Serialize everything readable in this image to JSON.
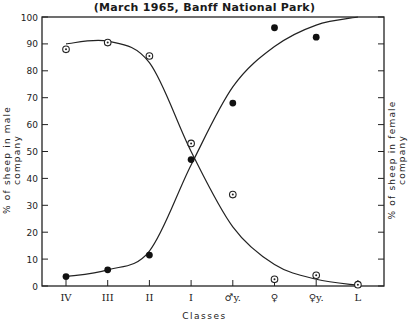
{
  "chart_data": {
    "type": "line",
    "title": "(March 1965, Banff National Park)",
    "xlabel": "Classes",
    "ylabel": "% of sheep in male company",
    "ylabel_right": "% of sheep in female company",
    "ylim": [
      0,
      100
    ],
    "yticks": [
      0,
      10,
      20,
      30,
      40,
      50,
      60,
      70,
      80,
      90,
      100
    ],
    "categories": [
      "IV",
      "III",
      "II",
      "I",
      "♂y.",
      "♀",
      "♀y.",
      "L"
    ],
    "grid": false,
    "legend": "none",
    "series": [
      {
        "name": "% of sheep in male company",
        "marker": "open-circle-dot",
        "values": [
          88,
          90.5,
          85.5,
          53,
          34,
          2.5,
          4,
          0.5
        ],
        "fitted_curve": true
      },
      {
        "name": "% of sheep in female company",
        "marker": "filled-circle",
        "values": [
          3.5,
          6,
          11.5,
          47,
          68,
          96,
          92.5,
          null
        ],
        "fitted_curve": true
      }
    ]
  }
}
